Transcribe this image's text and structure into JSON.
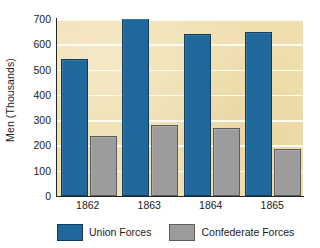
{
  "chart_data": {
    "type": "bar",
    "title": "",
    "subtitle": "",
    "xlabel": "",
    "ylabel": "Men (Thousands)",
    "categories": [
      "1862",
      "1863",
      "1864",
      "1865"
    ],
    "series": [
      {
        "name": "Union Forces",
        "color": "#20689c",
        "values": [
          535,
          695,
          633,
          640
        ]
      },
      {
        "name": "Confederate Forces",
        "color": "#9c9c9c",
        "values": [
          228,
          272,
          260,
          178
        ]
      }
    ],
    "ylim": [
      0,
      700
    ],
    "yticks": [
      0,
      100,
      200,
      300,
      400,
      500,
      600,
      700
    ],
    "ytick_labels": [
      "0",
      "100",
      "200",
      "300",
      "400",
      "500",
      "600",
      "700"
    ],
    "grid": true,
    "grid_color": "#fdfaf0",
    "legend_position": "bottom",
    "plot_background": "#f0dfae",
    "figure_background": "#ffffff",
    "axis_color": "#262626"
  },
  "legend": {
    "entries": [
      {
        "label": "Union Forces",
        "swatch": "union-color-swatch"
      },
      {
        "label": "Confederate Forces",
        "swatch": "confederate-color-swatch"
      }
    ]
  }
}
